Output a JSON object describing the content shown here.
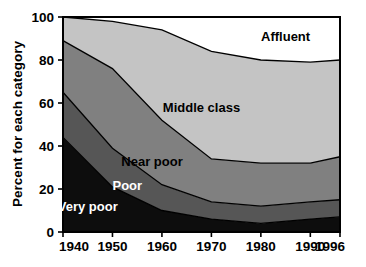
{
  "chart_data": {
    "type": "area",
    "title": "",
    "subtitle": "",
    "xlabel": "",
    "ylabel": "Percent for each category",
    "stacked": true,
    "stacked_to_percent": true,
    "grid": false,
    "legend_position": "inline-annotations",
    "x": [
      1940,
      1950,
      1960,
      1970,
      1980,
      1990,
      1996
    ],
    "xlim": [
      1940,
      1996
    ],
    "ylim": [
      0,
      100
    ],
    "xticks": [
      1940,
      1950,
      1960,
      1970,
      1980,
      1990,
      1996
    ],
    "xticklabels": [
      "1940",
      "1950",
      "1960",
      "1970",
      "1980",
      "1990",
      "1996"
    ],
    "yticks": [
      0,
      20,
      40,
      60,
      80,
      100
    ],
    "yticklabels": [
      "0",
      "20",
      "40",
      "60",
      "80",
      "100"
    ],
    "series": [
      {
        "name": "Very poor",
        "label": "Very poor",
        "color": "#0d0d0d",
        "label_color": "#ffffff",
        "values": [
          44,
          21,
          10,
          6,
          4,
          6,
          7
        ],
        "cumulative_top": [
          44,
          21,
          10,
          6,
          4,
          6,
          7
        ]
      },
      {
        "name": "Poor",
        "label": "Poor",
        "color": "#565656",
        "label_color": "#ffffff",
        "values": [
          21,
          18,
          12,
          8,
          8,
          8,
          8
        ],
        "cumulative_top": [
          65,
          39,
          22,
          14,
          12,
          14,
          15
        ]
      },
      {
        "name": "Near poor",
        "label": "Near poor",
        "color": "#808080",
        "label_color": "#000000",
        "values": [
          24,
          37,
          30,
          20,
          20,
          18,
          20
        ],
        "cumulative_top": [
          89,
          76,
          52,
          34,
          32,
          32,
          35
        ]
      },
      {
        "name": "Middle class",
        "label": "Middle class",
        "color": "#c4c4c4",
        "label_color": "#000000",
        "values": [
          11,
          22,
          42,
          50,
          48,
          47,
          45
        ],
        "cumulative_top": [
          100,
          98,
          94,
          84,
          80,
          79,
          80
        ]
      },
      {
        "name": "Affluent",
        "label": "Affluent",
        "color": "#ffffff",
        "label_color": "#000000",
        "values": [
          0,
          2,
          6,
          16,
          20,
          21,
          20
        ],
        "cumulative_top": [
          100,
          100,
          100,
          100,
          100,
          100,
          100
        ]
      }
    ],
    "annotations": [
      {
        "text": "Affluent",
        "x": 1985,
        "y": 91
      },
      {
        "text": "Middle class",
        "x": 1968,
        "y": 58
      },
      {
        "text": "Near poor",
        "x": 1958,
        "y": 33
      },
      {
        "text": "Poor",
        "x": 1953,
        "y": 22
      },
      {
        "text": "Very poor",
        "x": 1945,
        "y": 12
      }
    ]
  },
  "axes": {
    "y_title": "Percent for each category",
    "y_ticks": [
      "100",
      "80",
      "60",
      "40",
      "20",
      "0"
    ],
    "x_ticks": [
      "1940",
      "1950",
      "1960",
      "1970",
      "1980",
      "1990",
      "1996"
    ]
  },
  "labels": {
    "affluent": "Affluent",
    "middle_class": "Middle class",
    "near_poor": "Near poor",
    "poor": "Poor",
    "very_poor": "Very poor"
  }
}
